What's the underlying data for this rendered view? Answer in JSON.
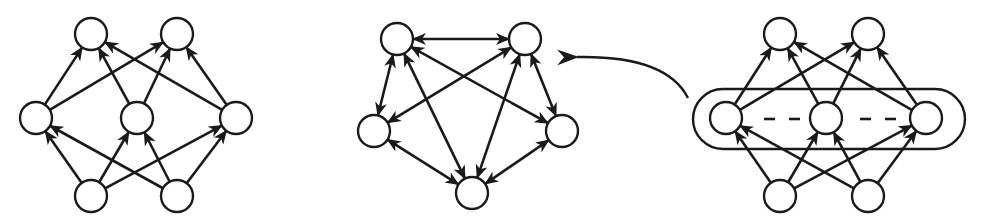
{
  "diagram": {
    "colors": {
      "stroke": "#1a1a1a",
      "node_fill": "#ffffff",
      "background": "#ffffff"
    },
    "node_radius": 16,
    "graphs": [
      {
        "id": "left-layered",
        "nodes": [
          {
            "id": "TL",
            "x": 91,
            "y": 34
          },
          {
            "id": "TR",
            "x": 177,
            "y": 34
          },
          {
            "id": "L",
            "x": 36,
            "y": 118
          },
          {
            "id": "M",
            "x": 137,
            "y": 118
          },
          {
            "id": "R",
            "x": 236,
            "y": 118
          },
          {
            "id": "BL",
            "x": 91,
            "y": 196
          },
          {
            "id": "BR",
            "x": 177,
            "y": 196
          }
        ],
        "edges": [
          {
            "from": "L",
            "to": "TL"
          },
          {
            "from": "L",
            "to": "TR"
          },
          {
            "from": "M",
            "to": "TL"
          },
          {
            "from": "M",
            "to": "TR"
          },
          {
            "from": "R",
            "to": "TL"
          },
          {
            "from": "R",
            "to": "TR"
          },
          {
            "from": "BL",
            "to": "L"
          },
          {
            "from": "BL",
            "to": "M"
          },
          {
            "from": "BL",
            "to": "R"
          },
          {
            "from": "BR",
            "to": "L"
          },
          {
            "from": "BR",
            "to": "M"
          },
          {
            "from": "BR",
            "to": "R"
          }
        ]
      },
      {
        "id": "middle-pentagon",
        "nodes": [
          {
            "id": "A",
            "x": 397,
            "y": 39
          },
          {
            "id": "B",
            "x": 525,
            "y": 39
          },
          {
            "id": "C",
            "x": 374,
            "y": 131
          },
          {
            "id": "D",
            "x": 562,
            "y": 131
          },
          {
            "id": "E",
            "x": 472,
            "y": 193
          }
        ],
        "edges": [
          {
            "from": "A",
            "to": "B",
            "bidirectional": true
          },
          {
            "from": "A",
            "to": "C",
            "bidirectional": true
          },
          {
            "from": "A",
            "to": "D",
            "bidirectional": true
          },
          {
            "from": "A",
            "to": "E",
            "bidirectional": true
          },
          {
            "from": "B",
            "to": "C",
            "bidirectional": true
          },
          {
            "from": "B",
            "to": "D",
            "bidirectional": true
          },
          {
            "from": "B",
            "to": "E",
            "bidirectional": true
          },
          {
            "from": "C",
            "to": "E",
            "bidirectional": true
          },
          {
            "from": "D",
            "to": "E",
            "bidirectional": true
          }
        ]
      },
      {
        "id": "right-layered",
        "nodes": [
          {
            "id": "TL",
            "x": 780,
            "y": 34
          },
          {
            "id": "TR",
            "x": 868,
            "y": 34
          },
          {
            "id": "L",
            "x": 726,
            "y": 118
          },
          {
            "id": "M",
            "x": 826,
            "y": 118
          },
          {
            "id": "R",
            "x": 926,
            "y": 118
          },
          {
            "id": "BL",
            "x": 780,
            "y": 196
          },
          {
            "id": "BR",
            "x": 868,
            "y": 196
          }
        ],
        "edges": [
          {
            "from": "L",
            "to": "TL"
          },
          {
            "from": "L",
            "to": "TR"
          },
          {
            "from": "M",
            "to": "TL"
          },
          {
            "from": "M",
            "to": "TR"
          },
          {
            "from": "R",
            "to": "TL"
          },
          {
            "from": "R",
            "to": "TR"
          },
          {
            "from": "BL",
            "to": "L"
          },
          {
            "from": "BL",
            "to": "M"
          },
          {
            "from": "BL",
            "to": "R"
          },
          {
            "from": "BR",
            "to": "L"
          },
          {
            "from": "BR",
            "to": "M"
          },
          {
            "from": "BR",
            "to": "R"
          }
        ],
        "pill": {
          "x": 693,
          "y": 89,
          "width": 272,
          "height": 60
        },
        "dashes": [
          {
            "x1": 764,
            "x2": 775,
            "y": 119
          },
          {
            "x1": 789,
            "x2": 800,
            "y": 119
          },
          {
            "x1": 860,
            "x2": 871,
            "y": 119
          },
          {
            "x1": 885,
            "x2": 896,
            "y": 119
          }
        ]
      }
    ],
    "transition_arrow": {
      "path": "M 688 98 C 672 66, 630 56, 577 57",
      "tip": {
        "x": 577,
        "y": 57
      }
    }
  }
}
